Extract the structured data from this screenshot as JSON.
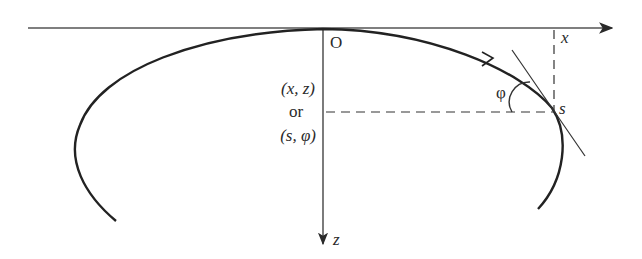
{
  "diagram": {
    "type": "coordinate-curve-schematic",
    "axes": {
      "horizontal": {
        "label": "x",
        "direction": "right"
      },
      "vertical": {
        "label": "z",
        "direction": "down"
      }
    },
    "origin_label": "O",
    "coordinates_label": {
      "line1": "(x, z)",
      "line2": "or",
      "line3": "(s, φ)"
    },
    "point_label": "s",
    "angle_label": "φ",
    "colors": {
      "stroke": "#2a2a2a",
      "background": "#ffffff"
    }
  }
}
